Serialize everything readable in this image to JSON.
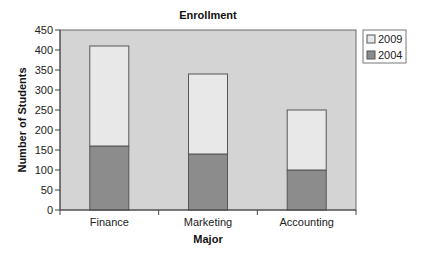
{
  "chart_data": {
    "type": "bar",
    "stacked": true,
    "title": "Enrollment",
    "xlabel": "Major",
    "ylabel": "Number of Students",
    "categories": [
      "Finance",
      "Marketing",
      "Accounting"
    ],
    "series": [
      {
        "name": "2004",
        "values": [
          160,
          140,
          100
        ],
        "color": "#8c8c8c"
      },
      {
        "name": "2009",
        "values": [
          250,
          200,
          150
        ],
        "color": "#e8e8e8"
      }
    ],
    "totals": [
      410,
      340,
      250
    ],
    "ylim": [
      0,
      450
    ],
    "yticks": [
      0,
      50,
      100,
      150,
      200,
      250,
      300,
      350,
      400,
      450
    ],
    "grid": false,
    "legend": {
      "placement": "top-right-outside",
      "entries": [
        "2009",
        "2004"
      ]
    },
    "plot_background": "#d4d4d4",
    "border_color": "#555555"
  }
}
